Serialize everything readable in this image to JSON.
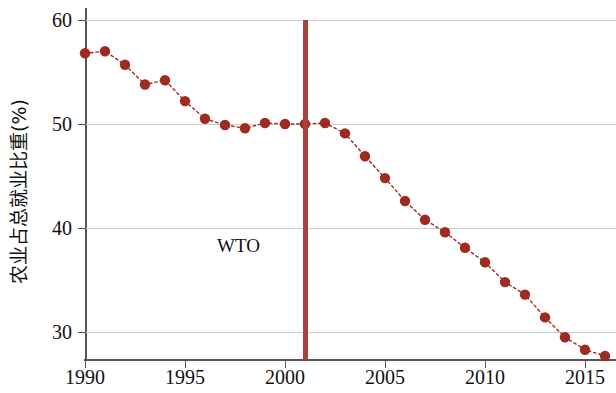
{
  "chart_data": {
    "type": "line",
    "title": "",
    "subtitle": "",
    "xlabel": "",
    "ylabel": "农业占总就业比重(%)",
    "xlim": [
      1989.2,
      1016.6
    ],
    "ylim": [
      26.5,
      60.5
    ],
    "xticks": [
      1990,
      1995,
      2000,
      2005,
      2010,
      2015
    ],
    "yticks": [
      30,
      40,
      50,
      60
    ],
    "xtick_labels": [
      "1990",
      "1995",
      "2000",
      "2005",
      "2010",
      "2015"
    ],
    "ytick_labels": [
      "30",
      "40",
      "50",
      "60"
    ],
    "grid": "horizontal",
    "legend": "none",
    "marker": "filled-circle",
    "linestyle": "dotted",
    "series": [
      {
        "name": "农业占总就业比重",
        "color": "#9e2a20",
        "x": [
          1990,
          1991,
          1992,
          1993,
          1994,
          1995,
          1996,
          1997,
          1998,
          1999,
          2000,
          2001,
          2002,
          2003,
          2004,
          2005,
          2006,
          2007,
          2008,
          2009,
          2010,
          2011,
          2012,
          2013,
          2014,
          2015,
          2016
        ],
        "values": [
          56.8,
          57.0,
          55.7,
          53.8,
          54.2,
          52.2,
          50.5,
          49.9,
          49.6,
          50.1,
          50.0,
          50.0,
          50.1,
          49.1,
          46.9,
          44.8,
          42.6,
          40.8,
          39.6,
          38.1,
          36.7,
          34.8,
          33.6,
          31.4,
          29.5,
          28.3,
          27.7
        ]
      }
    ],
    "annotations": [
      {
        "name": "wto-accession",
        "label": "WTO",
        "x": 2001,
        "type": "vline",
        "color": "#a8413a",
        "label_x": 1996.6,
        "label_y": 39.2
      }
    ]
  }
}
